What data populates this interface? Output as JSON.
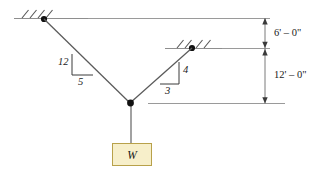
{
  "diagram": {
    "type": "statics-free-body-diagram",
    "colors": {
      "line": "#6f6f6f",
      "cable": "#5a5a5a",
      "joint": "#111111",
      "dimension": "#7a7a7a",
      "weight_fill": "#f7efca",
      "weight_border": "#b8a14a",
      "text": "#1a1a1a"
    },
    "supports": [
      {
        "name": "left-support",
        "hatch_count": 3
      },
      {
        "name": "right-support",
        "hatch_count": 3
      }
    ],
    "slope_triangles": [
      {
        "name": "left-cable-slope",
        "rise_label": "12",
        "run_label": "5"
      },
      {
        "name": "right-cable-slope",
        "rise_label": "4",
        "run_label": "3"
      }
    ],
    "dimensions": [
      {
        "name": "upper-dimension",
        "label": "6' – 0\""
      },
      {
        "name": "lower-dimension",
        "label": "12' – 0\""
      }
    ],
    "load": {
      "name": "weight-block",
      "label": "W"
    }
  }
}
